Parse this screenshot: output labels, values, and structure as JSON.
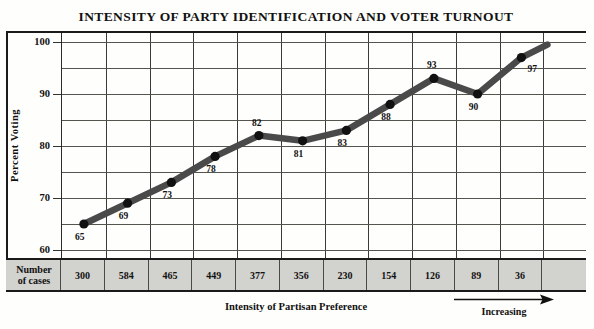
{
  "chart_data": {
    "type": "line",
    "title": "INTENSITY OF PARTY IDENTIFICATION AND VOTER TURNOUT",
    "xlabel": "Intensity of Partisan Preference",
    "ylabel": "Percent Voting",
    "ylim": [
      60,
      100
    ],
    "yticks": [
      60,
      70,
      80,
      90,
      100
    ],
    "grid": true,
    "legend": "none",
    "x_direction_note": "Increasing",
    "categories": [
      "1",
      "2",
      "3",
      "4",
      "5",
      "6",
      "7",
      "8",
      "9",
      "10",
      "11"
    ],
    "values": [
      65,
      69,
      73,
      78,
      82,
      81,
      83,
      88,
      93,
      90,
      97
    ],
    "point_labels": [
      "65",
      "69",
      "73",
      "78",
      "82",
      "81",
      "83",
      "88",
      "93",
      "90",
      "97"
    ],
    "table": {
      "row_header_line1": "Number",
      "row_header_line2": "of cases",
      "values": [
        "300",
        "584",
        "465",
        "449",
        "377",
        "356",
        "230",
        "154",
        "126",
        "89",
        "36"
      ]
    },
    "colors": {
      "line": "#4a4a4a",
      "marker": "#111111",
      "grid": "#55554f",
      "frame": "#1a1a1a",
      "table_fill": "#d2d2ce"
    }
  }
}
